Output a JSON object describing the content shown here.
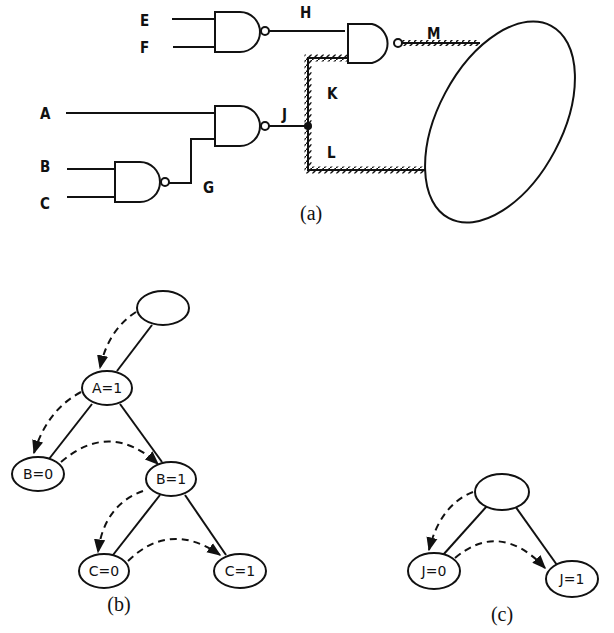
{
  "figure_a": {
    "caption": "(a)",
    "signals": {
      "E": "E",
      "F": "F",
      "H": "H",
      "M": "M",
      "A": "A",
      "J": "J",
      "K": "K",
      "L": "L",
      "B": "B",
      "C": "C",
      "G": "G"
    },
    "gates": [
      "NAND(E,F)->H",
      "NAND(H,K)->M",
      "NAND(A,G)->J",
      "NAND(B,C)->G"
    ],
    "cone": "ellipse"
  },
  "figure_b": {
    "caption": "(b)",
    "nodes": {
      "root": "",
      "a1": "A=1",
      "b0": "B=0",
      "b1": "B=1",
      "c0": "C=0",
      "c1": "C=1"
    }
  },
  "figure_c": {
    "caption": "(c)",
    "nodes": {
      "root": "",
      "j0": "J=0",
      "j1": "J=1"
    }
  }
}
